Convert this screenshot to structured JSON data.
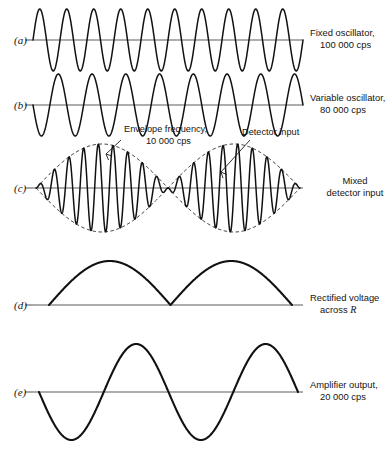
{
  "figure": {
    "width": 389,
    "height": 452,
    "background": "#ffffff",
    "ink": "#111111",
    "axis_color": "#5d5d5d"
  },
  "rows": [
    {
      "key": "a",
      "row_label": "(a)",
      "label_x": 14,
      "label_y": 44,
      "baseline_y": 40,
      "axis_x1": 33,
      "axis_x2": 303,
      "tick_x": 33,
      "side_label_x": 310,
      "side_label_lines": [
        "Fixed oscillator,",
        "100 000 cps"
      ],
      "side_label_y": 36,
      "wave": {
        "type": "sine",
        "x1": 33,
        "x2": 303,
        "cycles": 10,
        "amplitude": 31,
        "phase_deg": 0,
        "thickness": "wave"
      }
    },
    {
      "key": "b",
      "row_label": "(b)",
      "label_x": 14,
      "label_y": 109,
      "baseline_y": 105,
      "axis_x1": 33,
      "axis_x2": 303,
      "tick_x": 33,
      "side_label_x": 310,
      "side_label_lines": [
        "Variable oscillator,",
        "80 000 cps"
      ],
      "side_label_y": 101,
      "wave": {
        "type": "sine",
        "x1": 33,
        "x2": 303,
        "cycles": 8,
        "amplitude": 31,
        "phase_deg": 180,
        "thickness": "wave"
      }
    },
    {
      "key": "c",
      "row_label": "(c)",
      "label_x": 14,
      "label_y": 192,
      "baseline_y": 188,
      "axis_x1": 33,
      "axis_x2": 303,
      "tick_x": 33,
      "side_label_x": 331,
      "side_label_lines": [
        "Mixed",
        "detector input"
      ],
      "side_label_y": 184,
      "wave": {
        "type": "beat",
        "x1": 36,
        "x2": 300,
        "carrier_cycles": 18,
        "beat_cycles": 2,
        "amplitude": 44,
        "thickness": "wave",
        "envelope": true
      }
    },
    {
      "key": "d",
      "row_label": "(d)",
      "label_x": 14,
      "label_y": 309,
      "baseline_y": 305,
      "axis_x1": 33,
      "axis_x2": 303,
      "tick_x": 33,
      "side_label_x": 310,
      "side_label_lines": [
        "Rectified voltage",
        "across R"
      ],
      "side_label_italic_last_word": "R",
      "side_label_y": 301,
      "wave": {
        "type": "rectified",
        "x1": 49,
        "x2": 292,
        "humps": 2,
        "amplitude": 44,
        "thickness": "wave-thick"
      }
    },
    {
      "key": "e",
      "row_label": "(e)",
      "label_x": 14,
      "label_y": 396,
      "baseline_y": 392,
      "axis_x1": 33,
      "axis_x2": 303,
      "tick_x": 33,
      "side_label_x": 310,
      "side_label_lines": [
        "Amplifier output,",
        "20 000 cps"
      ],
      "side_label_y": 388,
      "wave": {
        "type": "sine",
        "x1": 39,
        "x2": 298,
        "cycles": 2,
        "amplitude": 48,
        "phase_deg": 180,
        "thickness": "wave-thick"
      }
    }
  ],
  "annotations": [
    {
      "name": "envelope-frequency",
      "lines": [
        "Envelope frequency,",
        "10 000 cps"
      ],
      "text_x": 124,
      "text_y": 132,
      "align": "start",
      "leader": {
        "x1": 121,
        "y1": 140,
        "x2": 106,
        "y2": 154
      },
      "arrowhead": {
        "x": 106,
        "y": 154,
        "angle_deg": 223
      }
    },
    {
      "name": "detector-input",
      "lines": [
        "Detector input"
      ],
      "text_x": 242,
      "text_y": 135,
      "align": "start",
      "leader": {
        "x1": 250,
        "y1": 140,
        "x2": 221,
        "y2": 172
      },
      "arrowhead": {
        "x": 221,
        "y": 172,
        "angle_deg": 228
      }
    }
  ],
  "chart_data": {
    "type": "line",
    "xlabel": "",
    "ylabel": "",
    "grid": false,
    "legend": "right",
    "series": [
      {
        "name": "(a) Fixed oscillator, 100 000 cps",
        "waveform": "sine",
        "frequency_cps": 100000,
        "relative_cycles": 10,
        "amplitude": 1.0
      },
      {
        "name": "(b) Variable oscillator, 80 000 cps",
        "waveform": "sine",
        "frequency_cps": 80000,
        "relative_cycles": 8,
        "amplitude": 1.0
      },
      {
        "name": "(c) Mixed detector input",
        "waveform": "beat",
        "carrier_cps": 90000,
        "envelope_cps": 10000,
        "relative_carrier_cycles": 18,
        "relative_beat_cycles": 2,
        "amplitude": 1.0
      },
      {
        "name": "(d) Rectified voltage across R",
        "waveform": "rectified-envelope",
        "frequency_cps": 20000,
        "relative_humps": 2,
        "amplitude": 1.0
      },
      {
        "name": "(e) Amplifier output, 20 000 cps",
        "waveform": "sine",
        "frequency_cps": 20000,
        "relative_cycles": 2,
        "amplitude": 1.0
      }
    ]
  }
}
